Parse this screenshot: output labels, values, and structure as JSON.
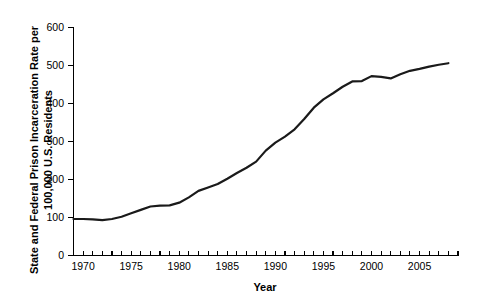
{
  "chart_data": {
    "type": "line",
    "title": "",
    "xlabel": "Year",
    "ylabel": "State and Federal Prison Incarceration Rate per 100,000 U.S. Residents",
    "ylabel_line1": "State and Federal Prison Incarceration Rate per",
    "ylabel_line2": "100,000 U.S. Residents",
    "xlim": [
      1969,
      2009
    ],
    "ylim": [
      0,
      600
    ],
    "grid": false,
    "legend": false,
    "x_tick_labels": [
      "1970",
      "1975",
      "1980",
      "1985",
      "1990",
      "1995",
      "2000",
      "2005"
    ],
    "x_tick_values": [
      1970,
      1975,
      1980,
      1985,
      1990,
      1995,
      2000,
      2005
    ],
    "x_minor_tick_step": 1,
    "y_tick_labels": [
      "0",
      "100",
      "200",
      "300",
      "400",
      "500",
      "600"
    ],
    "y_tick_values": [
      0,
      100,
      200,
      300,
      400,
      500,
      600
    ],
    "line_color": "#1a1a1a",
    "series": [
      {
        "name": "State and Federal Prison Incarceration Rate",
        "x": [
          1969,
          1970,
          1971,
          1972,
          1973,
          1974,
          1975,
          1976,
          1977,
          1978,
          1979,
          1980,
          1981,
          1982,
          1983,
          1984,
          1985,
          1986,
          1987,
          1988,
          1989,
          1990,
          1991,
          1992,
          1993,
          1994,
          1995,
          1996,
          1997,
          1998,
          1999,
          2000,
          2001,
          2002,
          2003,
          2004,
          2005,
          2006,
          2007,
          2008
        ],
        "values": [
          96,
          96,
          95,
          93,
          96,
          102,
          111,
          120,
          129,
          131,
          132,
          139,
          153,
          170,
          179,
          188,
          202,
          217,
          231,
          247,
          276,
          297,
          313,
          332,
          359,
          389,
          411,
          427,
          444,
          458,
          459,
          472,
          470,
          466,
          477,
          486,
          491,
          497,
          502,
          506
        ]
      }
    ],
    "annotations": []
  },
  "figure": {
    "background_color": "#ffffff",
    "axis_color": "#000000"
  }
}
